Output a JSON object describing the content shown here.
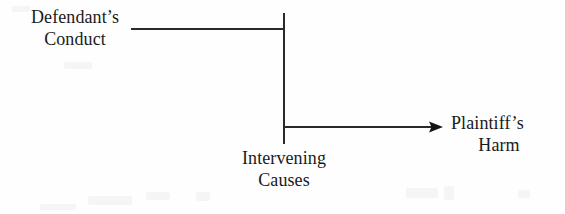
{
  "diagram": {
    "ink_color": "#1a1a1a",
    "background_color": "#fefefe",
    "nodes": [
      {
        "id": "defendant-conduct",
        "lines": [
          "Defendant’s",
          "Conduct"
        ],
        "text": "Defendant’s Conduct",
        "position": "top-left"
      },
      {
        "id": "intervening-causes",
        "lines": [
          "Intervening",
          "Causes"
        ],
        "text": "Intervening Causes",
        "position": "bottom-center"
      },
      {
        "id": "plaintiff-harm",
        "lines": [
          "Plaintiff’s",
          "Harm"
        ],
        "text": "Plaintiff’s Harm",
        "position": "middle-right"
      }
    ],
    "connectors": [
      {
        "id": "conduct-to-barrier",
        "kind": "line",
        "from": "defendant-conduct",
        "to": "intervening-causes",
        "arrowhead": false,
        "x1": 131,
        "y1": 29,
        "x2": 284,
        "y2": 29
      },
      {
        "id": "intervening-barrier",
        "kind": "line",
        "orientation": "vertical",
        "arrowhead": false,
        "x1": 283.5,
        "y1": 13,
        "x2": 283.5,
        "y2": 144
      },
      {
        "id": "barrier-to-harm",
        "kind": "arrow",
        "from": "intervening-causes",
        "to": "plaintiff-harm",
        "arrowhead": true,
        "x1": 284,
        "y1": 127,
        "x2": 443,
        "y2": 127
      }
    ]
  }
}
